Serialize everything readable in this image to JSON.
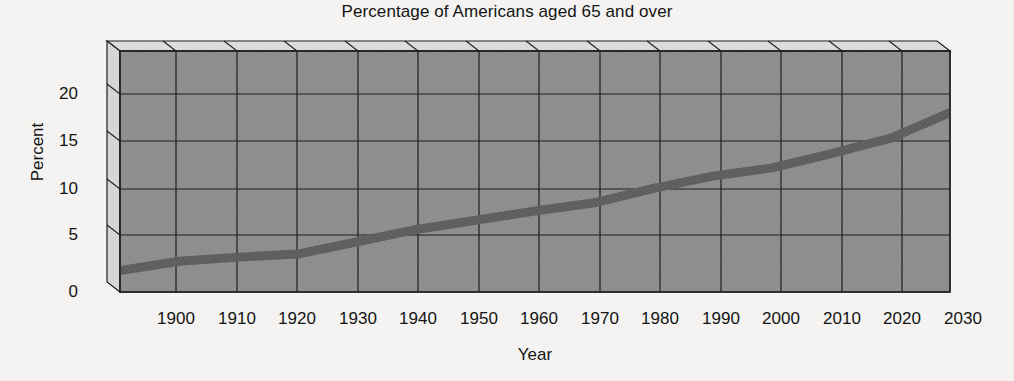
{
  "chart_data": {
    "type": "line",
    "title": "Percentage of Americans aged 65 and over",
    "xlabel": "Year",
    "ylabel": "Percent",
    "xlim": [
      1890,
      2030
    ],
    "ylim": [
      0,
      23.5
    ],
    "grid": true,
    "legend": null,
    "style": "3d-wall-line",
    "xticks": [
      1900,
      1910,
      1920,
      1930,
      1940,
      1950,
      1960,
      1970,
      1980,
      1990,
      2000,
      2010,
      2020,
      2030
    ],
    "yticks": [
      0,
      5,
      10,
      15,
      20
    ],
    "x": [
      1890,
      1900,
      1910,
      1920,
      1930,
      1940,
      1950,
      1960,
      1970,
      1980,
      1990,
      2000,
      2010,
      2020,
      2030
    ],
    "values": [
      2.1,
      3.0,
      3.4,
      3.7,
      4.9,
      6.1,
      7.0,
      7.9,
      8.7,
      10.1,
      11.3,
      12.1,
      13.5,
      15.0,
      17.5
    ],
    "series": [
      {
        "name": "Percent of Americans aged 65 and over",
        "values": [
          2.1,
          3.0,
          3.4,
          3.7,
          4.9,
          6.1,
          7.0,
          7.9,
          8.7,
          10.1,
          11.3,
          12.1,
          13.5,
          15.0,
          17.5
        ],
        "color": "#5e5e5e"
      }
    ],
    "colors": {
      "page_background": "#f4f3f1",
      "plot_wall": "#8e8e8e",
      "wall_3d_face": "#d9d9d9",
      "gridline": "#1f1f1f",
      "line": "#5e5e5e",
      "text": "#131313"
    }
  },
  "axis": {
    "y_tick_labels": [
      "20",
      "15",
      "10",
      "5",
      "0"
    ],
    "x_tick_labels": [
      "1900",
      "1910",
      "1920",
      "1930",
      "1940",
      "1950",
      "1960",
      "1970",
      "1980",
      "1990",
      "2000",
      "2010",
      "2020",
      "2030"
    ]
  }
}
